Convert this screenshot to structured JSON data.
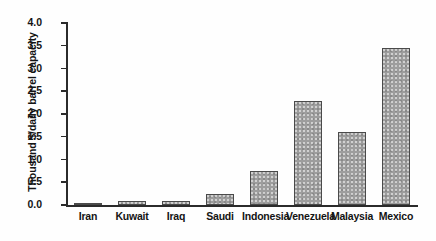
{
  "chart_data": {
    "type": "bar",
    "title": "",
    "xlabel": "",
    "ylabel": "Thousand $/daily barrel capacity",
    "categories": [
      "Iran",
      "Kuwait",
      "Iraq",
      "Saudi",
      "Indonesia",
      "Venezuela",
      "Malaysia",
      "Mexico"
    ],
    "values": [
      0.05,
      0.08,
      0.08,
      0.25,
      0.75,
      2.28,
      1.6,
      3.45
    ],
    "ylim": [
      0.0,
      4.0
    ],
    "ytick_step": 0.5,
    "ytick_labels": [
      "0.0",
      "0.5",
      "1.0",
      "1.5",
      "2.0",
      "2.5",
      "3.0",
      "3.5",
      "4.0"
    ],
    "grid": false,
    "legend": false,
    "bar_fill_color": "#9d9d9d",
    "bar_edge_color": "#4a4a4a",
    "axis_color": "#2b2b2b",
    "background_color": "#ffffff"
  }
}
